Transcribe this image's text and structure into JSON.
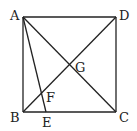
{
  "diagram": {
    "colors": {
      "stroke": "#222222",
      "background": "#ffffff"
    },
    "points": {
      "A": {
        "label": "A",
        "x": 23,
        "y": 17
      },
      "B": {
        "label": "B",
        "x": 23,
        "y": 112
      },
      "C": {
        "label": "C",
        "x": 116,
        "y": 112
      },
      "D": {
        "label": "D",
        "x": 116,
        "y": 17
      },
      "E": {
        "label": "E",
        "x": 46,
        "y": 112
      },
      "F": {
        "label": "F",
        "x": 42.6,
        "y": 93.4
      },
      "G": {
        "label": "G",
        "x": 69.5,
        "y": 64.5
      }
    },
    "segments": [
      "AB",
      "BC",
      "CD",
      "DA",
      "AC",
      "BD",
      "AE"
    ]
  }
}
